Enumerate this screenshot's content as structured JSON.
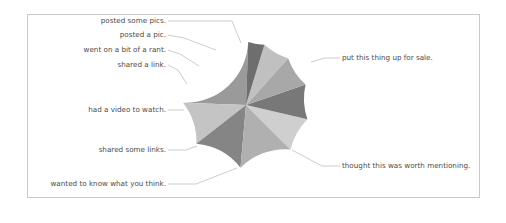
{
  "figure": {
    "background_color": "#ffffff",
    "frame_color": "#c9c9c9",
    "label_color": "#4a4a4a",
    "leader_color": "#b6b6b6"
  },
  "chart_data": {
    "type": "pie",
    "title": "",
    "xlabel": "",
    "ylabel": "",
    "legend_position": "none",
    "grid": false,
    "labels_position": "outside-with-leader-lines",
    "start_angle_deg": 90,
    "direction": "clockwise",
    "center": {
      "x": 246,
      "y": 105
    },
    "radius": 63,
    "categories": [
      "put this thing up for sale.",
      "thought this was worth mentioning.",
      "wanted to know what you think.",
      "shared some links.",
      "had a video to watch.",
      "shared a link.",
      "went on a bit of a rant.",
      "posted a pic.",
      "posted some pics."
    ],
    "values": [
      25,
      11,
      13,
      14,
      9,
      9,
      8,
      7,
      4
    ],
    "colors": [
      "#9a9a9a",
      "#c4c4c4",
      "#858585",
      "#b0b0b0",
      "#cfcfcf",
      "#787878",
      "#a8a8a8",
      "#c0c0c0",
      "#6e6e6e"
    ],
    "slices": [
      {
        "label": "put this thing up for sale.",
        "value": 25,
        "color": "#9a9a9a",
        "start_deg": 88,
        "end_deg": 178,
        "label_side": "right",
        "label_x": 342,
        "label_y": 60,
        "leader_from_x": 311,
        "leader_from_y": 62,
        "leader_mid_x": 325,
        "leader_mid_y": 58
      },
      {
        "label": "thought this was worth mentioning.",
        "value": 11,
        "color": "#c4c4c4",
        "start_deg": 178,
        "end_deg": 218,
        "label_side": "right",
        "label_x": 342,
        "label_y": 168,
        "leader_from_x": 292,
        "leader_from_y": 150,
        "leader_mid_x": 322,
        "leader_mid_y": 166
      },
      {
        "label": "wanted to know what you think.",
        "value": 13,
        "color": "#858585",
        "start_deg": 218,
        "end_deg": 265,
        "label_side": "left",
        "label_x": 166,
        "label_y": 186,
        "leader_from_x": 237,
        "leader_from_y": 168,
        "leader_mid_x": 196,
        "leader_mid_y": 184
      },
      {
        "label": "shared some links.",
        "value": 14,
        "color": "#b0b0b0",
        "start_deg": 265,
        "end_deg": 315,
        "label_side": "left",
        "label_x": 166,
        "label_y": 152,
        "leader_from_x": 197,
        "leader_from_y": 146,
        "leader_mid_x": 186,
        "leader_mid_y": 150
      },
      {
        "label": "had a video to watch.",
        "value": 9,
        "color": "#cfcfcf",
        "start_deg": 315,
        "end_deg": 347,
        "label_side": "left",
        "label_x": 166,
        "label_y": 112,
        "leader_from_x": 184,
        "leader_from_y": 110,
        "leader_mid_x": 176,
        "leader_mid_y": 110
      },
      {
        "label": "shared a link.",
        "value": 9,
        "color": "#787878",
        "start_deg": 347,
        "end_deg": 379,
        "label_side": "left",
        "label_x": 166,
        "label_y": 67,
        "leader_from_x": 187,
        "leader_from_y": 84,
        "leader_mid_x": 178,
        "leader_mid_y": 70
      },
      {
        "label": "went on a bit of a rant.",
        "value": 8,
        "color": "#a8a8a8",
        "start_deg": 379,
        "end_deg": 408,
        "label_side": "left",
        "label_x": 166,
        "label_y": 52,
        "leader_from_x": 199,
        "leader_from_y": 66,
        "leader_mid_x": 180,
        "leader_mid_y": 54
      },
      {
        "label": "posted a pic.",
        "value": 7,
        "color": "#c0c0c0",
        "start_deg": 408,
        "end_deg": 433,
        "label_side": "left",
        "label_x": 166,
        "label_y": 37,
        "leader_from_x": 216,
        "leader_from_y": 50,
        "leader_mid_x": 184,
        "leader_mid_y": 38
      },
      {
        "label": "posted some pics.",
        "value": 4,
        "color": "#6e6e6e",
        "start_deg": 433,
        "end_deg": 448,
        "label_side": "left",
        "label_x": 166,
        "label_y": 23,
        "leader_from_x": 241,
        "leader_from_y": 43,
        "leader_mid_x": 232,
        "leader_mid_y": 21
      }
    ]
  }
}
